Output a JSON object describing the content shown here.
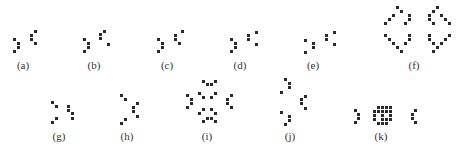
{
  "figure": {
    "dot_color": "#2a2a2a",
    "panels": [
      {
        "label": "(a)",
        "label_pos": [
          23,
          59
        ],
        "dots": [
          [
            13,
            38
          ],
          [
            17,
            42
          ],
          [
            17,
            46
          ],
          [
            13,
            50
          ],
          [
            34,
            30
          ],
          [
            30,
            34
          ],
          [
            30,
            38
          ],
          [
            34,
            42
          ]
        ]
      },
      {
        "label": "(b)",
        "label_pos": [
          94,
          59
        ],
        "dots": [
          [
            83,
            38
          ],
          [
            87,
            42
          ],
          [
            87,
            46
          ],
          [
            83,
            50
          ],
          [
            103,
            30
          ],
          [
            99,
            33
          ],
          [
            99,
            37
          ],
          [
            107,
            43
          ]
        ]
      },
      {
        "label": "(c)",
        "label_pos": [
          167,
          59
        ],
        "dots": [
          [
            157,
            38
          ],
          [
            161,
            42
          ],
          [
            161,
            46
          ],
          [
            157,
            50
          ],
          [
            181,
            30
          ],
          [
            174,
            34
          ],
          [
            174,
            38
          ],
          [
            178,
            42
          ]
        ]
      },
      {
        "label": "(d)",
        "label_pos": [
          240,
          59
        ],
        "dots": [
          [
            230,
            38
          ],
          [
            234,
            42
          ],
          [
            234,
            46
          ],
          [
            230,
            50
          ],
          [
            255,
            31
          ],
          [
            247,
            34
          ],
          [
            247,
            38
          ],
          [
            255,
            43
          ]
        ]
      },
      {
        "label": "(e)",
        "label_pos": [
          313,
          59
        ],
        "dots": [
          [
            304,
            39
          ],
          [
            312,
            42
          ],
          [
            312,
            46
          ],
          [
            304,
            51
          ],
          [
            333,
            31
          ],
          [
            325,
            34
          ],
          [
            325,
            38
          ],
          [
            333,
            43
          ]
        ]
      },
      {
        "label": "(f)",
        "label_pos": [
          414,
          59
        ],
        "dots": [
          [
            396,
            6
          ],
          [
            400,
            10
          ],
          [
            392,
            14
          ],
          [
            388,
            18
          ],
          [
            384,
            22
          ],
          [
            408,
            14
          ],
          [
            408,
            18
          ],
          [
            404,
            22
          ],
          [
            384,
            34
          ],
          [
            388,
            38
          ],
          [
            392,
            42
          ],
          [
            396,
            46
          ],
          [
            400,
            50
          ],
          [
            408,
            34
          ],
          [
            408,
            38
          ],
          [
            404,
            42
          ],
          [
            436,
            6
          ],
          [
            432,
            10
          ],
          [
            440,
            14
          ],
          [
            444,
            18
          ],
          [
            448,
            22
          ],
          [
            428,
            14
          ],
          [
            428,
            18
          ],
          [
            432,
            22
          ],
          [
            448,
            34
          ],
          [
            444,
            38
          ],
          [
            440,
            42
          ],
          [
            436,
            46
          ],
          [
            432,
            50
          ],
          [
            428,
            34
          ],
          [
            428,
            38
          ],
          [
            432,
            42
          ]
        ]
      },
      {
        "label": "(g)",
        "label_pos": [
          59,
          130
        ],
        "dots": [
          [
            51,
            101
          ],
          [
            55,
            105
          ],
          [
            55,
            117
          ],
          [
            51,
            121
          ],
          [
            67,
            105
          ],
          [
            67,
            109
          ],
          [
            71,
            112
          ],
          [
            71,
            117
          ]
        ]
      },
      {
        "label": "(h)",
        "label_pos": [
          127,
          130
        ],
        "dots": [
          [
            120,
            94
          ],
          [
            124,
            98
          ],
          [
            136,
            102
          ],
          [
            132,
            106
          ],
          [
            132,
            110
          ],
          [
            136,
            115
          ],
          [
            124,
            118
          ],
          [
            120,
            122
          ]
        ]
      },
      {
        "label": "(i)",
        "label_pos": [
          207,
          130
        ],
        "dots": [
          [
            202,
            80
          ],
          [
            206,
            83
          ],
          [
            210,
            83
          ],
          [
            214,
            80
          ],
          [
            186,
            94
          ],
          [
            190,
            98
          ],
          [
            190,
            102
          ],
          [
            186,
            106
          ],
          [
            198,
            92
          ],
          [
            202,
            96
          ],
          [
            214,
            92
          ],
          [
            210,
            96
          ],
          [
            230,
            94
          ],
          [
            226,
            98
          ],
          [
            226,
            102
          ],
          [
            230,
            106
          ],
          [
            198,
            112
          ],
          [
            202,
            108
          ],
          [
            214,
            112
          ],
          [
            210,
            108
          ],
          [
            202,
            120
          ],
          [
            206,
            117
          ],
          [
            210,
            117
          ],
          [
            214,
            120
          ]
        ]
      },
      {
        "label": "(j)",
        "label_pos": [
          290,
          130
        ],
        "dots": [
          [
            284,
            78
          ],
          [
            288,
            82
          ],
          [
            288,
            86
          ],
          [
            280,
            91
          ],
          [
            304,
            95
          ],
          [
            300,
            98
          ],
          [
            300,
            102
          ],
          [
            304,
            107
          ],
          [
            280,
            111
          ],
          [
            288,
            115
          ],
          [
            288,
            119
          ],
          [
            284,
            123
          ]
        ]
      },
      {
        "label": "(k)",
        "label_pos": [
          381,
          130
        ],
        "dots": [
          [
            354,
            109
          ],
          [
            357,
            113
          ],
          [
            357,
            117
          ],
          [
            354,
            121
          ],
          [
            373,
            110
          ],
          [
            385,
            110
          ],
          [
            377,
            106
          ],
          [
            381,
            106
          ],
          [
            385,
            106
          ],
          [
            389,
            106
          ],
          [
            381,
            110
          ],
          [
            381,
            114
          ],
          [
            381,
            118
          ],
          [
            373,
            118
          ],
          [
            377,
            122
          ],
          [
            381,
            122
          ],
          [
            385,
            122
          ],
          [
            389,
            118
          ],
          [
            389,
            110
          ],
          [
            373,
            114
          ],
          [
            389,
            114
          ],
          [
            385,
            118
          ],
          [
            377,
            110
          ],
          [
            414,
            109
          ],
          [
            411,
            113
          ],
          [
            411,
            117
          ],
          [
            414,
            121
          ]
        ]
      }
    ]
  }
}
